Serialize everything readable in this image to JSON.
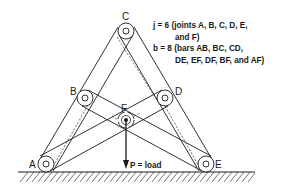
{
  "diagram": {
    "joints": [
      {
        "id": "A",
        "label": "A"
      },
      {
        "id": "B",
        "label": "B"
      },
      {
        "id": "C",
        "label": "C"
      },
      {
        "id": "D",
        "label": "D"
      },
      {
        "id": "E",
        "label": "E"
      },
      {
        "id": "F",
        "label": "F"
      }
    ],
    "load_label": "P = load",
    "annotation": {
      "line1": "j  =  6  (joints  A,  B,  C,  D,  E,",
      "line2": "and  F)",
      "line3": "b  =  8  (bars  AB,  BC,  CD,",
      "line4": "DE,  EF,  DF,  BF,  and  AF)"
    },
    "bars": [
      "AB",
      "BC",
      "CD",
      "DE",
      "EF",
      "DF",
      "BF",
      "AF"
    ],
    "joint_count": 6,
    "bar_count": 8
  }
}
